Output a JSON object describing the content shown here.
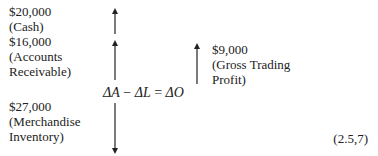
{
  "items": {
    "cash": {
      "amount": "$20,000",
      "label": "(Cash)"
    },
    "receivable": {
      "amount": "$16,000",
      "label1": "(Accounts",
      "label2": "Receivable)"
    },
    "inventory": {
      "amount": "$27,000",
      "label1": "(Merchandise",
      "label2": "Inventory)"
    },
    "profit": {
      "amount": "$9,000",
      "label1": "(Gross Trading",
      "label2": "Profit)"
    }
  },
  "equation": {
    "a": "ΔA",
    "minus": "−",
    "l": "ΔL",
    "eq": "=",
    "o": "ΔO"
  },
  "equation_ref": "(2.5,7)"
}
